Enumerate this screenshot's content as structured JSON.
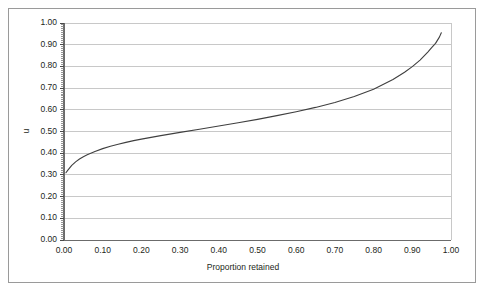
{
  "figure": {
    "background_color": "#ffffff",
    "border_color": "#9a9a9a"
  },
  "chart_data": {
    "type": "line",
    "title": "",
    "subtitle": "",
    "xlabel": "Proportion retained",
    "ylabel": "u",
    "xlim": [
      0.0,
      1.0
    ],
    "ylim": [
      0.0,
      1.0
    ],
    "grid": "horizontal",
    "legend": "none",
    "line_color": "#3f3f3f",
    "gridline_color": "#c8c8c8",
    "axis_color": "#6b6b6b",
    "xticks": [
      "0.00",
      "0.10",
      "0.20",
      "0.30",
      "0.40",
      "0.50",
      "0.60",
      "0.70",
      "0.80",
      "0.90",
      "1.00"
    ],
    "xtick_values": [
      0.0,
      0.1,
      0.2,
      0.3,
      0.4,
      0.5,
      0.6,
      0.7,
      0.8,
      0.9,
      1.0
    ],
    "yticks": [
      "0.00",
      "0.10",
      "0.20",
      "0.30",
      "0.40",
      "0.50",
      "0.60",
      "0.70",
      "0.80",
      "0.90",
      "1.00"
    ],
    "ytick_values": [
      0.0,
      0.1,
      0.2,
      0.3,
      0.4,
      0.5,
      0.6,
      0.7,
      0.8,
      0.9,
      1.0
    ],
    "series": [
      {
        "name": "u",
        "x": [
          0.005,
          0.01,
          0.02,
          0.03,
          0.04,
          0.05,
          0.06,
          0.08,
          0.1,
          0.12,
          0.14,
          0.16,
          0.18,
          0.2,
          0.25,
          0.3,
          0.35,
          0.4,
          0.45,
          0.5,
          0.55,
          0.6,
          0.65,
          0.7,
          0.75,
          0.8,
          0.85,
          0.88,
          0.9,
          0.92,
          0.94,
          0.95,
          0.96,
          0.97,
          0.975
        ],
        "y": [
          0.31,
          0.322,
          0.344,
          0.36,
          0.373,
          0.384,
          0.393,
          0.408,
          0.421,
          0.432,
          0.441,
          0.45,
          0.458,
          0.465,
          0.481,
          0.496,
          0.51,
          0.525,
          0.54,
          0.556,
          0.573,
          0.591,
          0.611,
          0.634,
          0.661,
          0.695,
          0.74,
          0.773,
          0.799,
          0.829,
          0.866,
          0.886,
          0.906,
          0.935,
          0.955
        ]
      }
    ]
  }
}
